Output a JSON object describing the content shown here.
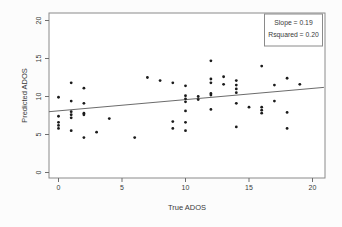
{
  "figure": {
    "background": "#fcfcfc",
    "plot_background": "#ffffff"
  },
  "colors": {
    "point": "#1b1b1b",
    "box_border": "#8a8a8a",
    "tick": "#6e6e6e",
    "text": "#3a3a3a",
    "regression_line": "#5a5a5a",
    "legend_border": "#8a8a8a"
  },
  "legend": {
    "slope_label": "Slope = 0.19",
    "rsquared_label": "Rsquared = 0.20"
  },
  "chart_data": {
    "type": "scatter",
    "title": "",
    "xlabel": "True ADOS",
    "ylabel": "Predicted ADOS",
    "xlim": [
      0,
      20
    ],
    "ylim": [
      0,
      20
    ],
    "xticks": [
      0,
      5,
      10,
      15,
      20
    ],
    "yticks": [
      0,
      5,
      10,
      15,
      20
    ],
    "grid": false,
    "legend_position": "top-right",
    "legend_lines": [
      "Slope = 0.19",
      "Rsquared = 0.20"
    ],
    "regression_line": {
      "x1": -0.75,
      "y1": 8.0,
      "x2": 20.9,
      "y2": 11.2,
      "slope": 0.19,
      "rsquared": 0.2
    },
    "points": [
      [
        0,
        9.9
      ],
      [
        0,
        7.4
      ],
      [
        0,
        6.6
      ],
      [
        0,
        6.2
      ],
      [
        0,
        5.8
      ],
      [
        1,
        11.8
      ],
      [
        1,
        9.4
      ],
      [
        1,
        8.0
      ],
      [
        1,
        7.6
      ],
      [
        1,
        7.2
      ],
      [
        1,
        5.5
      ],
      [
        2,
        11.1
      ],
      [
        2,
        9.1
      ],
      [
        2,
        7.8
      ],
      [
        2,
        7.6
      ],
      [
        2,
        4.6
      ],
      [
        3,
        5.3
      ],
      [
        4,
        7.1
      ],
      [
        6,
        4.6
      ],
      [
        7,
        12.5
      ],
      [
        8,
        12.1
      ],
      [
        9,
        11.8
      ],
      [
        9,
        6.7
      ],
      [
        9,
        5.8
      ],
      [
        10,
        11.4
      ],
      [
        10,
        10.1
      ],
      [
        10,
        9.7
      ],
      [
        10,
        9.3
      ],
      [
        10,
        8.1
      ],
      [
        10,
        6.6
      ],
      [
        10,
        5.5
      ],
      [
        11,
        10.0
      ],
      [
        11,
        9.6
      ],
      [
        12,
        14.7
      ],
      [
        12,
        12.3
      ],
      [
        12,
        11.8
      ],
      [
        12,
        10.4
      ],
      [
        12,
        10.2
      ],
      [
        12,
        8.3
      ],
      [
        13,
        12.6
      ],
      [
        13,
        11.6
      ],
      [
        14,
        12.1
      ],
      [
        14,
        11.5
      ],
      [
        14,
        11.0
      ],
      [
        14,
        10.5
      ],
      [
        14,
        9.1
      ],
      [
        14,
        6.0
      ],
      [
        15,
        8.6
      ],
      [
        16,
        14.0
      ],
      [
        16,
        8.6
      ],
      [
        16,
        8.2
      ],
      [
        16,
        7.8
      ],
      [
        17,
        11.5
      ],
      [
        17,
        9.4
      ],
      [
        18,
        12.4
      ],
      [
        18,
        7.9
      ],
      [
        18,
        5.8
      ],
      [
        19,
        11.6
      ]
    ]
  }
}
